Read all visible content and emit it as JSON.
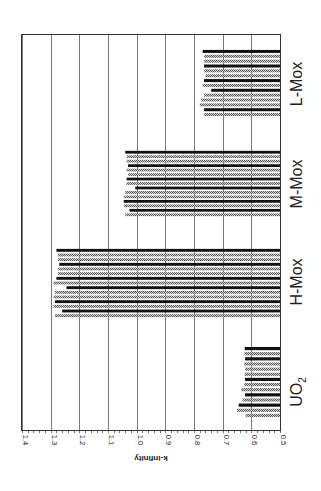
{
  "chart_data": {
    "type": "bar",
    "orientation": "rotated-90-ccw",
    "title": "",
    "xlabel": "",
    "ylabel": "k-infinity",
    "ylim": [
      0.5,
      1.4
    ],
    "yticks": [
      "0.5",
      "0.6",
      "0.7",
      "0.8",
      "0.9",
      "1.0",
      "1.1",
      "1.2",
      "1.3",
      "1.4"
    ],
    "grid": true,
    "legend": null,
    "categories": [
      "UO2",
      "H-Mox",
      "M-Mox",
      "L-Mox"
    ],
    "category_labels": [
      {
        "main": "UO",
        "sub": "2"
      },
      {
        "main": "H-Mox",
        "sub": ""
      },
      {
        "main": "M-Mox",
        "sub": ""
      },
      {
        "main": "L-Mox",
        "sub": ""
      }
    ],
    "series_styles": {
      "pattern": "#8a8a8a",
      "solid": "#111111"
    },
    "groups": [
      {
        "name": "UO2",
        "bars": [
          {
            "style": "pattern",
            "value": 0.62
          },
          {
            "style": "pattern",
            "value": 0.65
          },
          {
            "style": "solid",
            "value": 0.644
          },
          {
            "style": "pattern",
            "value": 0.63
          },
          {
            "style": "solid",
            "value": 0.622
          },
          {
            "style": "pattern",
            "value": 0.635
          },
          {
            "style": "pattern",
            "value": 0.625
          },
          {
            "style": "solid",
            "value": 0.622
          },
          {
            "style": "pattern",
            "value": 0.623
          },
          {
            "style": "pattern",
            "value": 0.622
          },
          {
            "style": "pattern",
            "value": 0.625
          },
          {
            "style": "solid",
            "value": 0.622
          },
          {
            "style": "pattern",
            "value": 0.624
          },
          {
            "style": "solid",
            "value": 0.623
          }
        ]
      },
      {
        "name": "H-Mox",
        "bars": [
          {
            "style": "pattern",
            "value": 1.285
          },
          {
            "style": "solid",
            "value": 1.26
          },
          {
            "style": "pattern",
            "value": 1.29
          },
          {
            "style": "solid",
            "value": 1.285
          },
          {
            "style": "pattern",
            "value": 1.29
          },
          {
            "style": "pattern",
            "value": 1.285
          },
          {
            "style": "solid",
            "value": 1.245
          },
          {
            "style": "pattern",
            "value": 1.29
          },
          {
            "style": "solid",
            "value": 1.28
          },
          {
            "style": "pattern",
            "value": 1.275
          },
          {
            "style": "pattern",
            "value": 1.275
          },
          {
            "style": "solid",
            "value": 1.27
          },
          {
            "style": "pattern",
            "value": 1.275
          },
          {
            "style": "pattern",
            "value": 1.275
          },
          {
            "style": "solid",
            "value": 1.28
          }
        ]
      },
      {
        "name": "M-Mox",
        "bars": [
          {
            "style": "pattern",
            "value": 1.04
          },
          {
            "style": "solid",
            "value": 1.025
          },
          {
            "style": "pattern",
            "value": 1.045
          },
          {
            "style": "solid",
            "value": 1.045
          },
          {
            "style": "pattern",
            "value": 1.045
          },
          {
            "style": "pattern",
            "value": 1.04
          },
          {
            "style": "solid",
            "value": 1.005
          },
          {
            "style": "pattern",
            "value": 1.035
          },
          {
            "style": "solid",
            "value": 1.035
          },
          {
            "style": "pattern",
            "value": 1.03
          },
          {
            "style": "pattern",
            "value": 1.035
          },
          {
            "style": "solid",
            "value": 1.03
          },
          {
            "style": "pattern",
            "value": 1.035
          },
          {
            "style": "pattern",
            "value": 1.035
          },
          {
            "style": "solid",
            "value": 1.04
          }
        ]
      },
      {
        "name": "L-Mox",
        "bars": [
          {
            "style": "pattern",
            "value": 0.765
          },
          {
            "style": "solid",
            "value": 0.765
          },
          {
            "style": "pattern",
            "value": 0.78
          },
          {
            "style": "pattern",
            "value": 0.775
          },
          {
            "style": "pattern",
            "value": 0.765
          },
          {
            "style": "solid",
            "value": 0.74
          },
          {
            "style": "pattern",
            "value": 0.77
          },
          {
            "style": "solid",
            "value": 0.765
          },
          {
            "style": "pattern",
            "value": 0.76
          },
          {
            "style": "pattern",
            "value": 0.765
          },
          {
            "style": "solid",
            "value": 0.765
          },
          {
            "style": "pattern",
            "value": 0.765
          },
          {
            "style": "pattern",
            "value": 0.765
          },
          {
            "style": "solid",
            "value": 0.77
          }
        ]
      }
    ]
  }
}
